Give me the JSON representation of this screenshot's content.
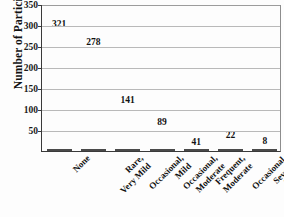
{
  "chart_data": {
    "type": "bar",
    "title": "",
    "xlabel": "",
    "ylabel": "Number of Participants",
    "ylim": [
      0,
      350
    ],
    "grid": true,
    "legend": "none",
    "orientation": "vertical",
    "bar_color": "#8c8c8c",
    "bar_edge_color": "#4a4a4a",
    "grid_color": "#b9b9b9",
    "axis_color": "#3a3a3a",
    "text_color": "#111111",
    "yticks": [
      0,
      50,
      100,
      150,
      200,
      250,
      300,
      350
    ],
    "ytick_labels": [
      "",
      "50",
      "100",
      "150",
      "200",
      "250",
      "300",
      "350"
    ],
    "categories": [
      "None",
      "Rare, Very Mild",
      "Occasional, Mild",
      "Occasional, Moderate",
      "Frequent, Moderate",
      "Occasional, Severe",
      "Frequent, Severe"
    ],
    "category_lines": [
      [
        "None"
      ],
      [
        "Rare,",
        "Very Mild"
      ],
      [
        "Occasional,",
        "Mild"
      ],
      [
        "Occasional,",
        "Moderate"
      ],
      [
        "Frequent,",
        "Moderate"
      ],
      [
        "Occasional,",
        "Severe"
      ],
      [
        "Frequent,",
        "Severe"
      ]
    ],
    "values": [
      321,
      278,
      141,
      89,
      41,
      22,
      8
    ],
    "value_labels": [
      "321",
      "278",
      "141",
      "89",
      "41",
      "22",
      "8"
    ],
    "label_placement": [
      "inside",
      "inside",
      "inside",
      "inside",
      "inside",
      "above",
      "above"
    ]
  }
}
